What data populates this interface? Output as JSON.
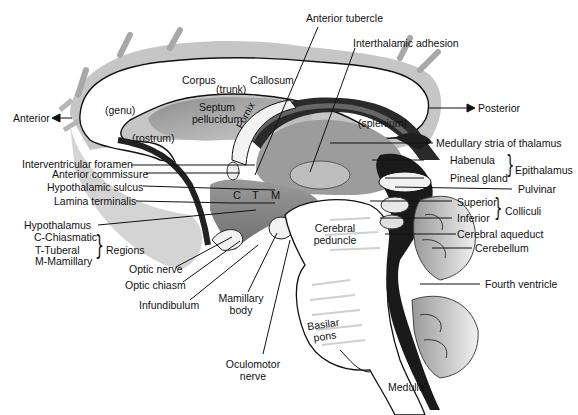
{
  "diagram": {
    "orientation": {
      "anterior": "Anterior",
      "posterior": "Posterior"
    },
    "corpus_callosum": {
      "corpus": "Corpus",
      "trunk": "(trunk)",
      "callosum": "Callosum",
      "genu": "(genu)",
      "rostrum": "(rostrum)",
      "splenium": "(splenium)"
    },
    "inner_labels": {
      "septum_pellucidum_line1": "Septum",
      "septum_pellucidum_line2": "pellucidum",
      "fornix": "Fornix",
      "cerebral_peduncle_line1": "Cerebral",
      "cerebral_peduncle_line2": "peduncle",
      "basilar_pons_line1": "Basilar",
      "basilar_pons_line2": "pons",
      "medulla": "Medulla",
      "region_c": "C",
      "region_t": "T",
      "region_m": "M"
    },
    "top_labels": {
      "anterior_tubercle": "Anterior tubercle",
      "interthalamic_adhesion": "Interthalamic adhesion"
    },
    "left_labels": {
      "interventricular_foramen": "Interventricular foramen",
      "anterior_commissure": "Anterior commissure",
      "hypothalamic_sulcus": "Hypothalamic sulcus",
      "lamina_terminalis": "Lamina terminalis",
      "hypothalamus": "Hypothalamus",
      "regions": {
        "items": [
          "C-Chiasmatic",
          "T-Tuberal",
          "M-Mamillary"
        ],
        "group_label": "Regions"
      }
    },
    "bottom_labels": {
      "optic_nerve": "Optic nerve",
      "optic_chiasm": "Optic chiasm",
      "infundibulum": "Infundibulum",
      "mamillary_body_line1": "Mamillary",
      "mamillary_body_line2": "body",
      "oculomotor_nerve_line1": "Oculomotor",
      "oculomotor_nerve_line2": "nerve"
    },
    "right_labels": {
      "medullary_stria": "Medullary stria of thalamus",
      "epithalamus": {
        "items": [
          "Habenula",
          "Pineal gland"
        ],
        "group_label": "Epithalamus"
      },
      "pulvinar": "Pulvinar",
      "colliculi": {
        "items": [
          "Superior",
          "Inferior"
        ],
        "group_label": "Colliculi"
      },
      "cerebral_aqueduct": "Cerebral aqueduct",
      "cerebellum": "Cerebellum",
      "fourth_ventricle": "Fourth ventricle"
    },
    "colors": {
      "background": "#ffffff",
      "ink": "#111111",
      "callosum_fill": "#ffffff",
      "septum_fill": "#b8b8b8",
      "gray_matter": "#8a8a8a",
      "dark_ventricle": "#1a1a1a",
      "cortex_shadow": "#9a9a9a"
    }
  }
}
